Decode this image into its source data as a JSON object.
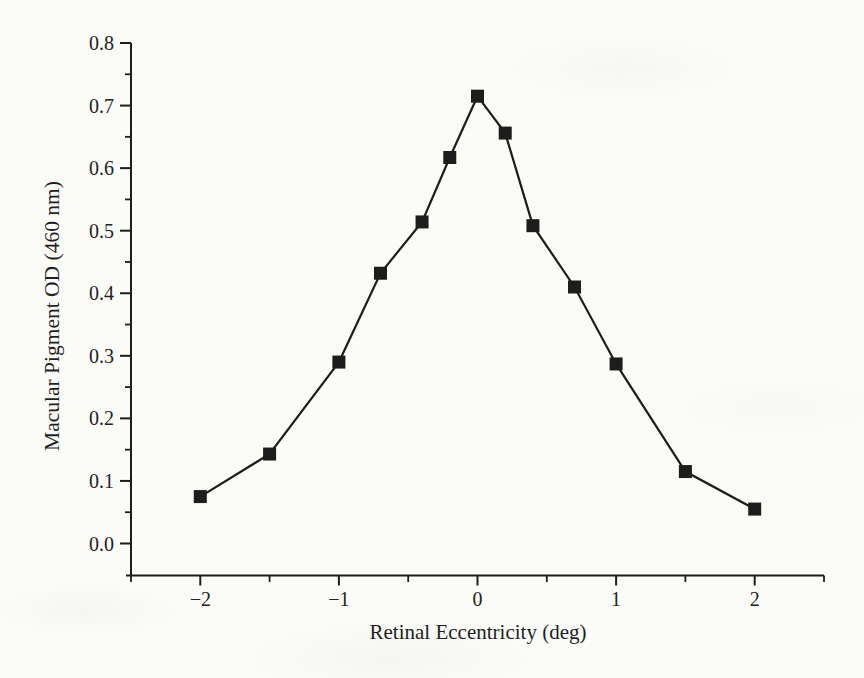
{
  "figure": {
    "kind": "scanned-book-line-figure",
    "background": "#fbfbf8",
    "ink": "#1d1d1d",
    "text_color": "#222222"
  },
  "chart_data": {
    "type": "line",
    "title": "",
    "xlabel": "Retinal Eccentricity (deg)",
    "ylabel": "Macular Pigment OD (460 nm)",
    "series": [
      {
        "name": "macular-pigment-od-profile",
        "x": [
          -2,
          -1.5,
          -1,
          -0.7,
          -0.4,
          -0.2,
          0,
          0.2,
          0.4,
          0.7,
          1,
          1.5,
          2
        ],
        "y": [
          0.075,
          0.143,
          0.29,
          0.432,
          0.514,
          0.617,
          0.715,
          0.656,
          0.508,
          0.41,
          0.287,
          0.115,
          0.055
        ]
      }
    ],
    "marker": "filled-square",
    "marker_size_px": 13,
    "line_width_px": 2.2,
    "xlim": [
      -2.5,
      2.5
    ],
    "ylim": [
      0,
      0.8
    ],
    "x_major_ticks": [
      -2,
      -1,
      0,
      1,
      2
    ],
    "x_major_tick_labels": [
      "−2",
      "−1",
      "0",
      "1",
      "2"
    ],
    "x_minor_ticks": [
      -2.5,
      -1.5,
      -0.5,
      0.5,
      1.5,
      2.5
    ],
    "y_major_ticks": [
      0,
      0.1,
      0.2,
      0.3,
      0.4,
      0.5,
      0.6,
      0.7,
      0.8
    ],
    "y_major_tick_labels": [
      "0.0",
      "0.1",
      "0.2",
      "0.3",
      "0.4",
      "0.5",
      "0.6",
      "0.7",
      "0.8"
    ],
    "y_minor_ticks": [
      0.05,
      0.15,
      0.25,
      0.35,
      0.45,
      0.55,
      0.65,
      0.75
    ],
    "grid": false,
    "legend": null
  }
}
